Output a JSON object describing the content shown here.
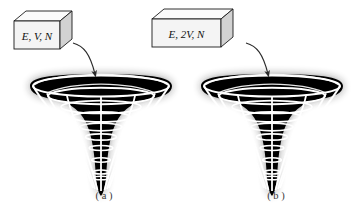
{
  "figure": {
    "type": "scientific-diagram",
    "background_color": "#ffffff",
    "panels": [
      {
        "id": "a",
        "caption": "( a )",
        "box_label": "E, V, N",
        "well_label": "gravity-well-funnel"
      },
      {
        "id": "b",
        "caption": "( b )",
        "box_label": "E, 2V, N",
        "well_label": "gravity-well-funnel"
      }
    ]
  },
  "panel_a": {
    "box_label": "E, V, N",
    "caption": "( a )"
  },
  "panel_b": {
    "box_label": "E, 2V, N",
    "caption": "( b )"
  },
  "colors": {
    "funnel_fill": "#000000",
    "wireframe": "#ffffff",
    "box_face": "#f4f4f4",
    "box_top": "#fbfbfb",
    "box_side": "#d2d2d2",
    "outline": "#1a1a1a",
    "leader_line": "#2b2b2b",
    "caption": "#3a3a3a"
  }
}
